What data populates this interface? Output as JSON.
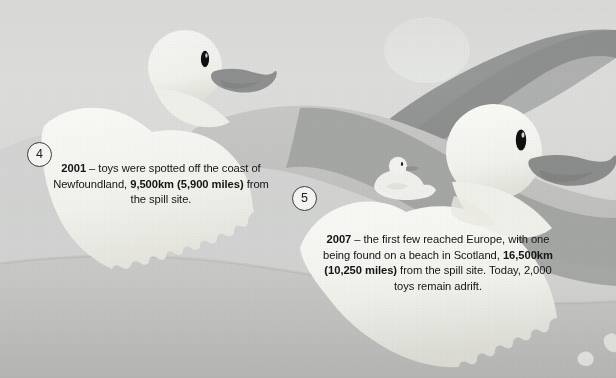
{
  "scene": {
    "title": "Rubber duck ocean spill infographic panel",
    "width": 616,
    "height": 378,
    "palette": {
      "background": "#d6d7d6",
      "background_light": "#e4e5e3",
      "wave_mid": "#c3c5c3",
      "wave_dark": "#9a9c9a",
      "wave_darkest": "#87898a",
      "duck_body": "#f5f5f1",
      "duck_body_shadow": "#e6e6e0",
      "beak": "#8d8f8e",
      "eye": "#111111",
      "text": "#141414",
      "marker_outline": "#3c3c3c",
      "marker_fill": "#f3f3f0"
    }
  },
  "callouts": [
    {
      "number": "4",
      "year": "2001",
      "dash": " – ",
      "text_plain": "2001 – toys were spotted off the coast of Newfoundland, 9,500km (5,900 miles) from the spill site.",
      "segments": [
        {
          "text": "2001",
          "bold": true
        },
        {
          "text": " – toys were spotted off the coast of Newfoundland, ",
          "bold": false
        },
        {
          "text": "9,500km (5,900 miles)",
          "bold": true
        },
        {
          "text": " from the spill site.",
          "bold": false
        }
      ]
    },
    {
      "number": "5",
      "year": "2007",
      "dash": " – ",
      "text_plain": "2007 – the first few reached Europe, with one being found on a beach in Scotland, 16,500km (10,250 miles) from the spill site. Today, 2,000 toys remain adrift.",
      "segments": [
        {
          "text": "2007",
          "bold": true
        },
        {
          "text": " – the first few reached Europe, with one being found on a beach in Scotland, ",
          "bold": false
        },
        {
          "text": "16,500km (10,250 miles)",
          "bold": true
        },
        {
          "text": " from the spill site. Today, 2,000 toys remain adrift.",
          "bold": false
        }
      ]
    }
  ],
  "ducks": [
    {
      "name": "duck-top-left",
      "size": "medium",
      "facing": "right"
    },
    {
      "name": "duck-small-center",
      "size": "small",
      "facing": "right"
    },
    {
      "name": "duck-large-right",
      "size": "large",
      "facing": "right"
    }
  ]
}
